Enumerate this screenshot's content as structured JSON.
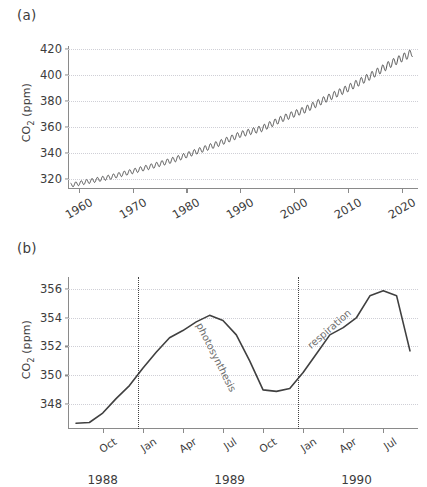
{
  "figure": {
    "background": "#ffffff",
    "line_color": "#404040",
    "grid_color": "#cfcfd6",
    "text_color": "#3c3c3c",
    "annotation_color": "#6e6e6e"
  },
  "panels": {
    "a": {
      "label": "(a)",
      "ylabel_prefix": "CO",
      "ylabel_sub": "2",
      "ylabel_suffix": " (ppm)"
    },
    "b": {
      "label": "(b)",
      "ylabel_prefix": "CO",
      "ylabel_sub": "2",
      "ylabel_suffix": " (ppm)"
    }
  },
  "chart_data": [
    {
      "panel": "a",
      "type": "line",
      "title": "",
      "xlabel": "",
      "ylabel": "CO2 (ppm)",
      "xlim": [
        1958,
        2023
      ],
      "ylim": [
        312,
        422
      ],
      "xticks": [
        1960,
        1970,
        1980,
        1990,
        2000,
        2010,
        2020
      ],
      "xtick_labels": [
        "1960",
        "1970",
        "1980",
        "1990",
        "2000",
        "2010",
        "2020"
      ],
      "yticks": [
        320,
        340,
        360,
        380,
        400,
        420
      ],
      "ytick_labels": [
        "320",
        "340",
        "360",
        "380",
        "400",
        "420"
      ],
      "grid": "horizontal-dotted",
      "legend": "none",
      "description": "Keeling curve: monthly mean atmospheric CO2 at Mauna Loa with seasonal sawtooth superimposed on a rising trend.",
      "series": [
        {
          "name": "Monthly mean CO2",
          "trend_x": [
            1958.5,
            1962,
            1966,
            1970,
            1974,
            1978,
            1982,
            1986,
            1990,
            1994,
            1998,
            2002,
            2006,
            2010,
            2014,
            2018,
            2022
          ],
          "trend_y": [
            315.0,
            318.0,
            321.3,
            325.6,
            330.0,
            335.0,
            341.0,
            347.0,
            354.0,
            358.5,
            366.5,
            373.0,
            381.5,
            389.5,
            398.5,
            408.5,
            417.0
          ],
          "seasonal_amplitude_ppm": 3.0,
          "cycles_per_year": 1
        }
      ]
    },
    {
      "panel": "b",
      "type": "line",
      "title": "",
      "xlabel": "",
      "ylabel": "CO2 (ppm)",
      "xlim_months": [
        "1988-08",
        "1990-09"
      ],
      "ylim": [
        346.3,
        356.8
      ],
      "yticks": [
        348,
        350,
        352,
        354,
        356
      ],
      "ytick_labels": [
        "348",
        "350",
        "352",
        "354",
        "356"
      ],
      "xtick_labels": [
        "Oct",
        "Jan",
        "Apr",
        "Jul",
        "Oct",
        "Jan",
        "Apr",
        "Jul"
      ],
      "xgroup_labels": [
        "1988",
        "1989",
        "1990"
      ],
      "grid": "horizontal-dotted",
      "legend": "none",
      "vertical_markers": [
        {
          "label": "year boundary 1988/1989",
          "at": "1989-01"
        },
        {
          "label": "year boundary 1989/1990",
          "at": "1990-01"
        }
      ],
      "annotations": [
        {
          "text": "photosynthesis",
          "rotation_deg": -63
        },
        {
          "text": "respiration",
          "rotation_deg": 41
        }
      ],
      "description": "Zoom on 1988-1990 monthly mean CO2 showing the seasonal cycle: drawdown by photosynthesis in the northern growing season and rise from respiration in winter.",
      "series": [
        {
          "name": "Monthly mean CO2",
          "x_months": [
            "1988-08",
            "1988-09",
            "1988-10",
            "1988-11",
            "1988-12",
            "1989-01",
            "1989-02",
            "1989-03",
            "1989-04",
            "1989-05",
            "1989-06",
            "1989-07",
            "1989-08",
            "1989-09",
            "1989-10",
            "1989-11",
            "1989-12",
            "1990-01",
            "1990-02",
            "1990-03",
            "1990-04",
            "1990-05",
            "1990-06",
            "1990-07",
            "1990-08"
          ],
          "values": [
            346.7,
            346.75,
            347.4,
            348.4,
            349.3,
            350.5,
            351.6,
            352.6,
            353.1,
            353.7,
            354.15,
            353.8,
            352.8,
            351.0,
            349.0,
            348.9,
            349.1,
            350.2,
            351.5,
            352.8,
            353.3,
            354.0,
            355.5,
            355.85,
            355.5
          ],
          "extra_x": [
            "1990-09"
          ],
          "extra_values": [
            351.7
          ]
        }
      ]
    }
  ]
}
